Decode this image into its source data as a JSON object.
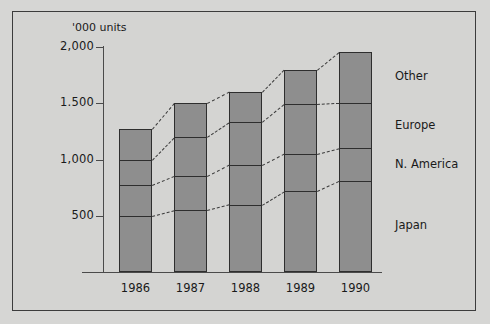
{
  "chart_data": {
    "type": "bar",
    "title": "",
    "subtitle": "",
    "units_label": "'000 units",
    "xlabel": "",
    "ylabel": "'000 units",
    "stacked": true,
    "orientation": "vertical",
    "grid": false,
    "legend_position": "right",
    "ylim": [
      0,
      2000
    ],
    "yticks": [
      500,
      1000,
      1500,
      2000
    ],
    "ytick_labels": [
      "500",
      "1,000",
      "1.500",
      "2,000"
    ],
    "categories": [
      "1986",
      "1987",
      "1988",
      "1989",
      "1990"
    ],
    "series": [
      {
        "name": "Japan",
        "values": [
          500,
          550,
          600,
          720,
          810
        ]
      },
      {
        "name": "N. America",
        "values": [
          270,
          300,
          350,
          330,
          290
        ]
      },
      {
        "name": "Europe",
        "values": [
          230,
          350,
          380,
          440,
          400
        ]
      },
      {
        "name": "Other",
        "values": [
          270,
          300,
          270,
          310,
          460
        ]
      }
    ],
    "cumulative_tops": {
      "Japan": [
        500,
        550,
        600,
        720,
        810
      ],
      "N. America": [
        770,
        850,
        950,
        1050,
        1100
      ],
      "Europe": [
        1000,
        1200,
        1330,
        1490,
        1500
      ],
      "Other": [
        1270,
        1500,
        1600,
        1800,
        1960
      ]
    },
    "totals": [
      1270,
      1500,
      1600,
      1800,
      1960
    ],
    "legend_entries": [
      "Other",
      "Europe",
      "N. America",
      "Japan"
    ],
    "colors": {
      "bar_fill": "#8e8e8e",
      "bar_stroke": "#2e2e2e",
      "axis": "#4a4a4a",
      "connector": "#3a3a3a",
      "background": "#d4d4d2",
      "frame": "#3c3c3c",
      "text": "#1a1a1a"
    }
  }
}
